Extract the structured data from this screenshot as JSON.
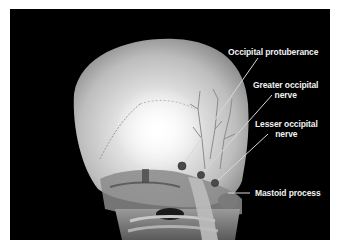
{
  "figure": {
    "background_color": "#000000",
    "labels": [
      {
        "id": "occipital-protuberance",
        "line1": "Occipital protuberance",
        "line2": ""
      },
      {
        "id": "greater-occipital-nerve",
        "line1": "Greater occipital",
        "line2": "nerve"
      },
      {
        "id": "lesser-occipital-nerve",
        "line1": "Lesser occipital",
        "line2": "nerve"
      },
      {
        "id": "mastoid-process",
        "line1": "Mastoid process",
        "line2": ""
      }
    ]
  }
}
